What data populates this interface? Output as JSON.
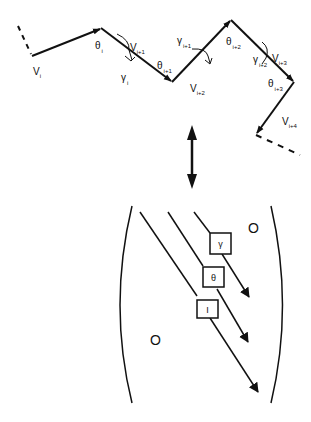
{
  "chain": {
    "vectors": [
      {
        "name": "V",
        "sub": "i"
      },
      {
        "name": "V",
        "sub": "i+1"
      },
      {
        "name": "V",
        "sub": "i+2"
      },
      {
        "name": "V",
        "sub": "i+3"
      },
      {
        "name": "V",
        "sub": "i+4"
      }
    ],
    "bend_angles": [
      {
        "name": "θ",
        "sub": "i"
      },
      {
        "name": "θ",
        "sub": "i+1"
      },
      {
        "name": "θ",
        "sub": "i+2"
      },
      {
        "name": "θ",
        "sub": "i+3"
      }
    ],
    "torsion_angles": [
      {
        "name": "γ",
        "sub": "i"
      },
      {
        "name": "γ",
        "sub": "i+1"
      },
      {
        "name": "γ",
        "sub": "i+2"
      }
    ]
  },
  "equivalence_arrow": "double-headed vertical arrow",
  "matrix": {
    "diagonals": [
      {
        "label": "I"
      },
      {
        "label": "θ"
      },
      {
        "label": "γ"
      }
    ],
    "upper_zero": "O",
    "lower_zero": "O"
  },
  "colors": {
    "ink": "#111111",
    "background": "#ffffff"
  }
}
